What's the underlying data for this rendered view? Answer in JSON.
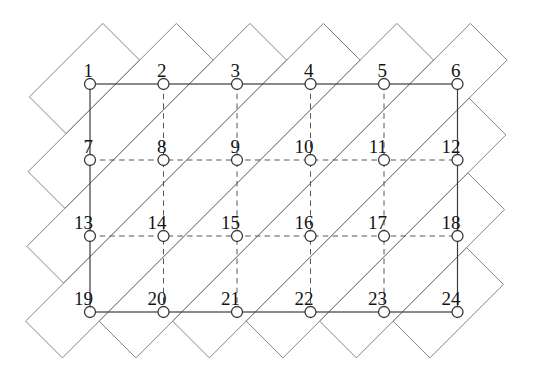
{
  "figure": {
    "width": 536,
    "height": 381,
    "background": "#ffffff",
    "styles": {
      "strip_stroke": "#848484",
      "strip_stroke_width": 1,
      "solid_stroke": "#3c3c3c",
      "solid_stroke_width": 1.2,
      "dashed_stroke": "#565656",
      "dashed_stroke_width": 1,
      "dash_pattern": "5.5 4.2",
      "node_fill": "#ffffff",
      "node_stroke": "#3a3a3a",
      "node_stroke_width": 1.3,
      "node_radius": 5.5,
      "label_color": "#141414",
      "label_font_size": 19,
      "label_dx": 3,
      "label_dy": -7
    },
    "grid": {
      "cols": [
        90,
        163.5,
        237,
        310.5,
        384,
        457.5
      ],
      "rows": [
        84,
        160,
        236,
        312
      ]
    },
    "nodes": [
      {
        "label": "1",
        "col": 0,
        "row": 0
      },
      {
        "label": "2",
        "col": 1,
        "row": 0
      },
      {
        "label": "3",
        "col": 2,
        "row": 0
      },
      {
        "label": "4",
        "col": 3,
        "row": 0
      },
      {
        "label": "5",
        "col": 4,
        "row": 0
      },
      {
        "label": "6",
        "col": 5,
        "row": 0
      },
      {
        "label": "7",
        "col": 0,
        "row": 1
      },
      {
        "label": "8",
        "col": 1,
        "row": 1
      },
      {
        "label": "9",
        "col": 2,
        "row": 1
      },
      {
        "label": "10",
        "col": 3,
        "row": 1
      },
      {
        "label": "11",
        "col": 4,
        "row": 1
      },
      {
        "label": "12",
        "col": 5,
        "row": 1
      },
      {
        "label": "13",
        "col": 0,
        "row": 2
      },
      {
        "label": "14",
        "col": 1,
        "row": 2
      },
      {
        "label": "15",
        "col": 2,
        "row": 2
      },
      {
        "label": "16",
        "col": 3,
        "row": 2
      },
      {
        "label": "17",
        "col": 4,
        "row": 2
      },
      {
        "label": "18",
        "col": 5,
        "row": 2
      },
      {
        "label": "19",
        "col": 0,
        "row": 3
      },
      {
        "label": "20",
        "col": 1,
        "row": 3
      },
      {
        "label": "21",
        "col": 2,
        "row": 3
      },
      {
        "label": "22",
        "col": 3,
        "row": 3
      },
      {
        "label": "23",
        "col": 4,
        "row": 3
      },
      {
        "label": "24",
        "col": 5,
        "row": 3
      }
    ],
    "strips": [
      [
        [
          102.9,
          23.4
        ],
        [
          139.6,
          60.1
        ],
        [
          66.1,
          133.6
        ],
        [
          29.4,
          96.9
        ]
      ],
      [
        [
          176.4,
          23.4
        ],
        [
          213.1,
          60.1
        ],
        [
          64.9,
          208.4
        ],
        [
          28.1,
          171.6
        ]
      ],
      [
        [
          249.9,
          23.4
        ],
        [
          286.6,
          60.1
        ],
        [
          63.6,
          283.1
        ],
        [
          26.9,
          246.4
        ]
      ],
      [
        [
          323.4,
          23.4
        ],
        [
          360.1,
          60.1
        ],
        [
          62.4,
          357.9
        ],
        [
          25.6,
          321.1
        ]
      ],
      [
        [
          396.9,
          23.4
        ],
        [
          433.6,
          60.1
        ],
        [
          135.9,
          357.9
        ],
        [
          99.1,
          321.1
        ]
      ],
      [
        [
          470.4,
          23.4
        ],
        [
          507.1,
          60.1
        ],
        [
          209.4,
          357.9
        ],
        [
          172.6,
          321.1
        ]
      ],
      [
        [
          469.1,
          98.1
        ],
        [
          505.9,
          134.9
        ],
        [
          282.9,
          357.9
        ],
        [
          246.1,
          321.1
        ]
      ],
      [
        [
          467.9,
          172.9
        ],
        [
          504.6,
          209.6
        ],
        [
          356.4,
          357.9
        ],
        [
          319.6,
          321.1
        ]
      ],
      [
        [
          466.6,
          247.6
        ],
        [
          503.4,
          284.4
        ],
        [
          429.9,
          357.9
        ],
        [
          393.1,
          321.1
        ]
      ]
    ]
  }
}
